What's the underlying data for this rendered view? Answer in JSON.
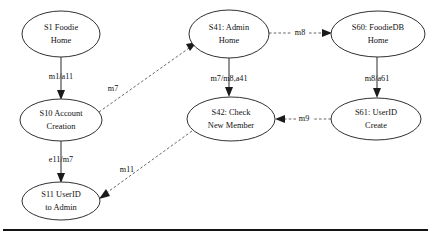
{
  "diagram": {
    "type": "state-transition-diagram",
    "title": "",
    "nodes": [
      {
        "id": "S1",
        "label_line1": "S1 Foodie",
        "label_line2": "Home",
        "cx": 61,
        "cy": 34,
        "rx": 39,
        "ry": 23
      },
      {
        "id": "S10",
        "label_line1": "S10 Account",
        "label_line2": "Creation",
        "cx": 61,
        "cy": 120,
        "rx": 41,
        "ry": 21
      },
      {
        "id": "S11",
        "label_line1": "S11 UserID",
        "label_line2": "to Admin",
        "cx": 61,
        "cy": 201,
        "rx": 39,
        "ry": 19
      },
      {
        "id": "S41",
        "label_line1": "S41: Admin",
        "label_line2": "Home",
        "cx": 229,
        "cy": 34,
        "rx": 40,
        "ry": 24
      },
      {
        "id": "S42",
        "label_line1": "S42: Check",
        "label_line2": "New Member",
        "cx": 231,
        "cy": 119,
        "rx": 44,
        "ry": 22
      },
      {
        "id": "S60",
        "label_line1": "S60: FoodieDB",
        "label_line2": "Home",
        "cx": 378,
        "cy": 34,
        "rx": 47,
        "ry": 23
      },
      {
        "id": "S61",
        "label_line1": "S61: UserID",
        "label_line2": "Create",
        "cx": 376,
        "cy": 119,
        "rx": 45,
        "ry": 21
      }
    ],
    "edges": [
      {
        "id": "e-s1-s10",
        "from": "S1",
        "to": "S10",
        "label": "m1/a11",
        "style": "solid",
        "label_x": 61,
        "label_y": 77
      },
      {
        "id": "e-s10-s11",
        "from": "S10",
        "to": "S11",
        "label": "e11/m7",
        "style": "solid",
        "label_x": 61,
        "label_y": 160
      },
      {
        "id": "e-s10-s41",
        "from": "S10",
        "to": "S41",
        "label": "m7",
        "style": "dashed",
        "label_x": 113,
        "label_y": 89
      },
      {
        "id": "e-s42-s11",
        "from": "S42",
        "to": "S11",
        "label": "m11",
        "style": "dashed",
        "label_x": 127,
        "label_y": 170
      },
      {
        "id": "e-s41-s42",
        "from": "S41",
        "to": "S42",
        "label": "m7/m8,a41",
        "style": "solid",
        "label_x": 229,
        "label_y": 79
      },
      {
        "id": "e-s41-s60",
        "from": "S41",
        "to": "S60",
        "label": "m8",
        "style": "dashed",
        "label_x": 300,
        "label_y": 33
      },
      {
        "id": "e-s60-s61",
        "from": "S60",
        "to": "S61",
        "label": "m8/a61",
        "style": "solid",
        "label_x": 377,
        "label_y": 79
      },
      {
        "id": "e-s61-s42",
        "from": "S61",
        "to": "S42",
        "label": "m9",
        "style": "dashed",
        "label_x": 304,
        "label_y": 119
      }
    ],
    "divider": {
      "y": 230,
      "x1": 3,
      "x2": 428
    }
  }
}
